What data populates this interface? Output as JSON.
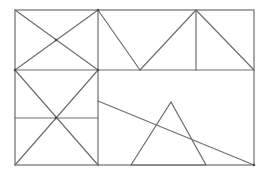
{
  "diagram": {
    "type": "geometric-line-figure",
    "stroke_color": "#6e6e6e",
    "background": "#ffffff",
    "outer_rect": {
      "x1": 15,
      "y1": 10,
      "x2": 254,
      "y2": 165
    },
    "segments": [
      {
        "name": "divider-vertical-left",
        "x1": 98,
        "y1": 10,
        "x2": 98,
        "y2": 165
      },
      {
        "name": "divider-horizontal-middle",
        "x1": 15,
        "y1": 70,
        "x2": 254,
        "y2": 70
      },
      {
        "name": "top-left-diagonal-a",
        "x1": 15,
        "y1": 10,
        "x2": 98,
        "y2": 70
      },
      {
        "name": "top-left-diagonal-b",
        "x1": 98,
        "y1": 10,
        "x2": 15,
        "y2": 70
      },
      {
        "name": "top-v-left-arm",
        "x1": 98,
        "y1": 10,
        "x2": 140,
        "y2": 70
      },
      {
        "name": "top-v-right-arm",
        "x1": 140,
        "y1": 70,
        "x2": 196,
        "y2": 10
      },
      {
        "name": "top-right-vertical",
        "x1": 196,
        "y1": 10,
        "x2": 196,
        "y2": 70
      },
      {
        "name": "top-right-diagonal",
        "x1": 196,
        "y1": 10,
        "x2": 254,
        "y2": 70
      },
      {
        "name": "bottom-left-horizontal",
        "x1": 15,
        "y1": 118,
        "x2": 98,
        "y2": 118
      },
      {
        "name": "bottom-left-diagonal-a",
        "x1": 15,
        "y1": 70,
        "x2": 98,
        "y2": 165
      },
      {
        "name": "bottom-left-diagonal-b",
        "x1": 98,
        "y1": 70,
        "x2": 15,
        "y2": 165
      },
      {
        "name": "bottom-right-slant",
        "x1": 98,
        "y1": 101,
        "x2": 254,
        "y2": 165
      }
    ],
    "triangle": {
      "points": [
        [
          131,
          165
        ],
        [
          171,
          102
        ],
        [
          206,
          165
        ]
      ]
    },
    "vertices": [
      [
        98,
        10
      ],
      [
        15,
        70
      ],
      [
        98,
        70
      ],
      [
        56,
        40
      ],
      [
        56,
        118
      ],
      [
        254,
        165
      ]
    ]
  }
}
